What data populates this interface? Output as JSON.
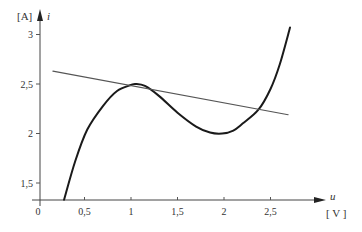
{
  "chart_data": {
    "type": "line",
    "title": "",
    "xlabel": "u",
    "xunit": "[V]",
    "ylabel": "i",
    "yunit": "[A]",
    "xlim": [
      0,
      2.8
    ],
    "ylim": [
      1.33,
      3.2
    ],
    "grid": false,
    "legend": null,
    "x_ticks": [
      "0",
      "0,5",
      "1",
      "1,5",
      "2",
      "2,5"
    ],
    "x_tick_values": [
      0,
      0.5,
      1,
      1.5,
      2,
      2.5
    ],
    "y_ticks": [
      "1,5",
      "2",
      "2,5",
      "3"
    ],
    "y_tick_values": [
      1.5,
      2,
      2.5,
      3
    ],
    "series": [
      {
        "name": "characteristic curve",
        "style": "thick",
        "x": [
          0.28,
          0.4,
          0.53,
          0.7,
          0.85,
          1.0,
          1.05,
          1.15,
          1.3,
          1.5,
          1.7,
          1.85,
          1.98,
          2.1,
          2.2,
          2.37,
          2.5,
          2.6,
          2.71
        ],
        "y": [
          1.33,
          1.72,
          2.04,
          2.28,
          2.43,
          2.49,
          2.5,
          2.48,
          2.38,
          2.21,
          2.07,
          2.01,
          2.0,
          2.03,
          2.1,
          2.24,
          2.45,
          2.7,
          3.07
        ]
      },
      {
        "name": "load line",
        "style": "thin",
        "x": [
          0.16,
          2.69
        ],
        "y": [
          2.63,
          2.19
        ]
      }
    ]
  },
  "axes": {
    "x_var": "u",
    "x_unit": "[ V ]",
    "y_var": "i",
    "y_unit": "[A]"
  }
}
